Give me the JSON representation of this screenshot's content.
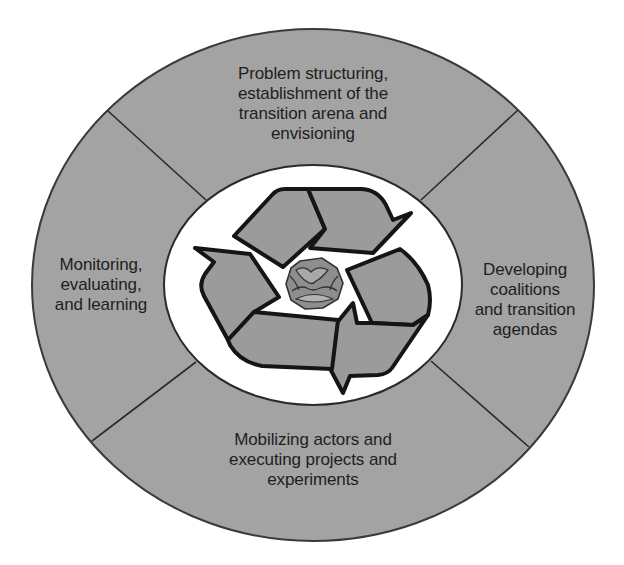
{
  "diagram": {
    "type": "cycle",
    "center_graphic": "recycling-arrows-around-globe",
    "colors": {
      "ring_fill": "#a3a3a3",
      "ring_stroke": "#3a3a3a",
      "inner_fill": "#ffffff",
      "arrow_fill": "#9b9b9b",
      "arrow_stroke": "#151515",
      "globe_fill": "#8e8e8e"
    },
    "segments": [
      {
        "position": "top",
        "lines": [
          "Problem structuring,",
          "establishment of the",
          "transition arena and",
          "envisioning"
        ]
      },
      {
        "position": "right",
        "lines": [
          "Developing",
          "coalitions",
          "and transition",
          "agendas"
        ]
      },
      {
        "position": "bottom",
        "lines": [
          "Mobilizing actors and",
          "executing projects and",
          "experiments"
        ]
      },
      {
        "position": "left",
        "lines": [
          "Monitoring,",
          "evaluating,",
          "and learning"
        ]
      }
    ]
  }
}
